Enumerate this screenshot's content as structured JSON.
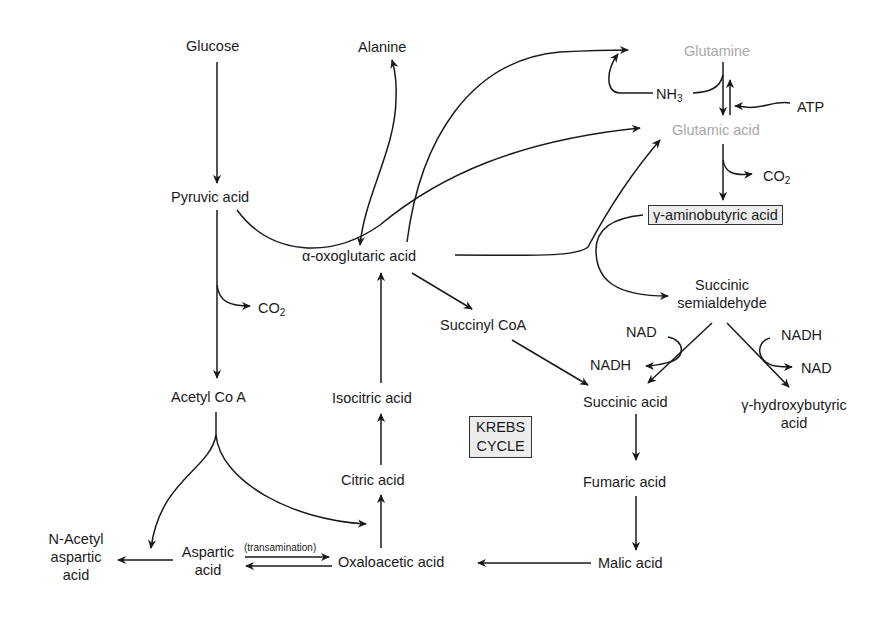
{
  "diagram": {
    "nodes": {
      "glucose": "Glucose",
      "alanine": "Alanine",
      "glutamine": "Glutamine",
      "nh3_base": "NH",
      "nh3_sub": "3",
      "atp": "ATP",
      "glutamic_acid": "Glutamic acid",
      "co2_top_base": "CO",
      "co2_top_sub": "2",
      "gaba": "γ-aminobutyric acid",
      "pyruvic_acid": "Pyruvic acid",
      "alpha_oxoglutaric_acid": "α-oxoglutaric acid",
      "succinic_semialdehyde_line1": "Succinic",
      "succinic_semialdehyde_line2": "semialdehyde",
      "co2_left_base": "CO",
      "co2_left_sub": "2",
      "succinyl_coa": "Succinyl CoA",
      "nad_left": "NAD",
      "nadh_left": "NADH",
      "nadh_right": "NADH",
      "nad_right": "NAD",
      "acetyl_coa": "Acetyl Co A",
      "isocitric_acid": "Isocitric acid",
      "succinic_acid": "Succinic acid",
      "ghb_line1": "γ-hydroxybutyric",
      "ghb_line2": "acid",
      "krebs_line1": "KREBS",
      "krebs_line2": "CYCLE",
      "citric_acid": "Citric acid",
      "fumaric_acid": "Fumaric acid",
      "n_acetyl_line1": "N-Acetyl",
      "n_acetyl_line2": "aspartic",
      "n_acetyl_line3": "acid",
      "aspartic_line1": "Aspartic",
      "aspartic_line2": "acid",
      "transamination": "(transamination)",
      "oxaloacetic_acid": "Oxaloacetic acid",
      "malic_acid": "Malic acid"
    },
    "colors": {
      "text": "#1a1a1a",
      "highlight_gray_text": "#a9a9a9",
      "box_fill": "#ececec"
    },
    "edges": [
      {
        "from": "Glucose",
        "to": "Pyruvic acid"
      },
      {
        "from": "Pyruvic acid",
        "to": "Acetyl Co A"
      },
      {
        "from": "Pyruvic acid",
        "to": "CO2"
      },
      {
        "from": "Pyruvic acid",
        "to": "Glutamic acid"
      },
      {
        "from": "Alanine",
        "to": "α-oxoglutaric acid",
        "bidirectional_curve": true
      },
      {
        "from": "α-oxoglutaric acid",
        "to": "Glutamine"
      },
      {
        "from": "α-oxoglutaric acid",
        "to": "Glutamic acid"
      },
      {
        "from": "α-oxoglutaric acid",
        "to": "Succinyl CoA"
      },
      {
        "from": "γ-aminobutyric acid",
        "to": "Succinic semialdehyde"
      },
      {
        "from": "Glutamine",
        "to": "Glutamic acid"
      },
      {
        "from": "Glutamic acid",
        "to": "Glutamine",
        "cofactor": "ATP"
      },
      {
        "from": "NH3",
        "to": "Glutamine"
      },
      {
        "from": "Glutamic acid",
        "to": "γ-aminobutyric acid",
        "byproduct": "CO2"
      },
      {
        "from": "Succinic semialdehyde",
        "to": "Succinic acid",
        "cofactor": "NAD→NADH"
      },
      {
        "from": "Succinic semialdehyde",
        "to": "γ-hydroxybutyric acid",
        "cofactor": "NADH→NAD"
      },
      {
        "from": "Succinyl CoA",
        "to": "Succinic acid"
      },
      {
        "from": "Succinic acid",
        "to": "Fumaric acid"
      },
      {
        "from": "Fumaric acid",
        "to": "Malic acid"
      },
      {
        "from": "Malic acid",
        "to": "Oxaloacetic acid"
      },
      {
        "from": "Oxaloacetic acid",
        "to": "Citric acid"
      },
      {
        "from": "Citric acid",
        "to": "Isocitric acid"
      },
      {
        "from": "Isocitric acid",
        "to": "α-oxoglutaric acid"
      },
      {
        "from": "Acetyl Co A",
        "to": "Oxaloacetic acid"
      },
      {
        "from": "Acetyl Co A",
        "to": "Aspartic acid"
      },
      {
        "from": "Aspartic acid",
        "to": "Oxaloacetic acid",
        "label": "(transamination)"
      },
      {
        "from": "Oxaloacetic acid",
        "to": "Aspartic acid"
      },
      {
        "from": "Aspartic acid",
        "to": "N-Acetyl aspartic acid"
      }
    ]
  }
}
